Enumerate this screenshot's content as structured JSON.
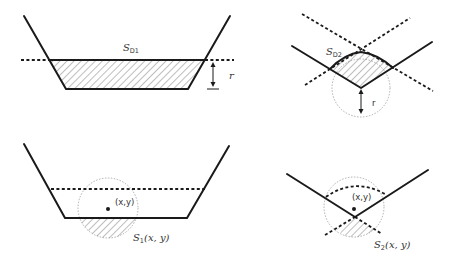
{
  "panels": {
    "top_left": {
      "title_main": "S",
      "title_sub": "D1",
      "r_label": "r",
      "description": "Trapezoidal channel; hatched region S_D1 below the dashed line at depth r"
    },
    "top_right": {
      "title_main": "S",
      "title_sub": "D2",
      "r_label": "r",
      "description": "V-shaped corner; hatched region S_D2 between the walls and the circle of radius r"
    },
    "bottom_left": {
      "point_label": "(x,y)",
      "area_main": "S",
      "area_sub": "1",
      "area_args": "(x, y)",
      "description": "Circle centered at (x,y) intersecting flat channel bottom; hatched area S_1(x,y)"
    },
    "bottom_right": {
      "point_label": "(x,y)",
      "area_main": "S",
      "area_sub": "2",
      "area_args": "(x, y)",
      "description": "Circle centered at (x,y) near V corner; hatched area S_2(x,y)"
    }
  },
  "colors": {
    "stroke": "#1a1a1a",
    "circle": "#9a9a9a",
    "background": "#ffffff"
  }
}
